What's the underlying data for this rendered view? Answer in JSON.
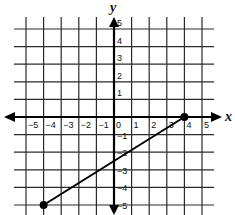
{
  "chart_data": {
    "type": "line",
    "title": "",
    "xlabel": "x",
    "ylabel": "y",
    "xlim": [
      -5,
      5
    ],
    "ylim": [
      -5,
      5
    ],
    "grid": true,
    "x_ticks": [
      "−5",
      "−4",
      "−3",
      "−2",
      "−1",
      "0",
      "1",
      "2",
      "3",
      "4",
      "5"
    ],
    "y_ticks_pos": [
      "1",
      "2",
      "3",
      "4",
      "5"
    ],
    "y_ticks_neg": [
      "−1",
      "−2",
      "−3",
      "−4",
      "−5"
    ],
    "series": [
      {
        "name": "segment",
        "points": [
          [
            -4,
            -5
          ],
          [
            4,
            0
          ]
        ],
        "endpoints_marked": true
      }
    ]
  },
  "colors": {
    "grid": "#2a2a2a",
    "axis": "#000000",
    "line": "#000000"
  }
}
